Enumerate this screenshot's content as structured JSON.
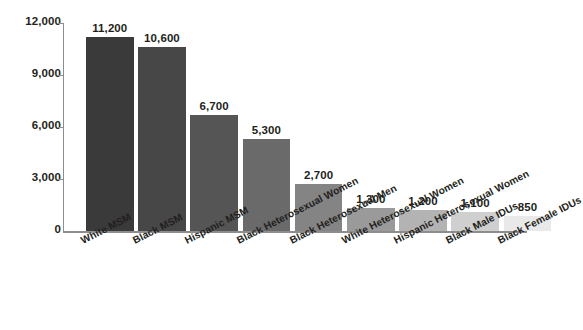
{
  "chart_data": {
    "type": "bar",
    "title": "",
    "subtitle": "",
    "xlabel": "",
    "ylabel": "",
    "ylim": [
      0,
      12000
    ],
    "grid": false,
    "legend": "none",
    "orientation": "vertical",
    "y_ticks": [
      "0",
      "3,000",
      "6,000",
      "9,000",
      "12,000"
    ],
    "y_tick_values": [
      0,
      3000,
      6000,
      9000,
      12000
    ],
    "categories": [
      "White MSM",
      "Black MSM",
      "Hispanic MSM",
      "Black Heterosexual Women",
      "Black Heterosexual Men",
      "White Heterosexual Women",
      "Hispanic Heterosexual Women",
      "Black Male IDUs",
      "Black Female IDUs"
    ],
    "values": [
      11200,
      10600,
      6700,
      5300,
      2700,
      1300,
      1200,
      1100,
      850
    ],
    "value_labels": [
      "11,200",
      "10,600",
      "6,700",
      "5,300",
      "2,700",
      "1,300",
      "1,200",
      "1,100",
      "850"
    ],
    "bar_colors": [
      "#3a3a3a",
      "#474747",
      "#555555",
      "#6a6a6a",
      "#848484",
      "#9a9a9a",
      "#b3b3b3",
      "#cfcfcf",
      "#e9e9e9"
    ],
    "axis_color": "#8d8d8d",
    "text_color": "#231f20",
    "background_color": "#ffffff"
  }
}
